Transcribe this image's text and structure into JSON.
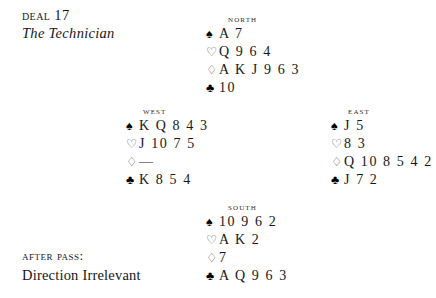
{
  "title": {
    "deal_prefix": "D",
    "deal_word": "eal",
    "deal_number": "17",
    "deal_full": "Deal 17",
    "subtitle": "The Technician"
  },
  "footer": {
    "after_pass_label": "After Pass:",
    "direction_note": "Direction Irrelevant"
  },
  "suits": {
    "spade": "♠",
    "heart": "♡",
    "diamond": "♢",
    "club": "♣"
  },
  "hands": {
    "north": {
      "label": "North",
      "spades": "A 7",
      "hearts": "Q 9 6 4",
      "diamonds": "A K J 9 6 3",
      "clubs": "10"
    },
    "west": {
      "label": "West",
      "spades": "K Q 8 4 3",
      "hearts": "J 10 7 5",
      "diamonds": "—",
      "clubs": "K 8 5 4"
    },
    "east": {
      "label": "East",
      "spades": "J 5",
      "hearts": "8 3",
      "diamonds": "Q 10 8 5 4 2",
      "clubs": "J 7 2"
    },
    "south": {
      "label": "South",
      "spades": "10 9 6 2",
      "hearts": "A K 2",
      "diamonds": "7",
      "clubs": "A Q 9 6 3"
    }
  },
  "colors": {
    "page_background": "#ffffff",
    "text": "#15171a",
    "label_text": "#2b2d31",
    "suit_black": "#000000",
    "suit_hollow": "#4a4d52"
  }
}
